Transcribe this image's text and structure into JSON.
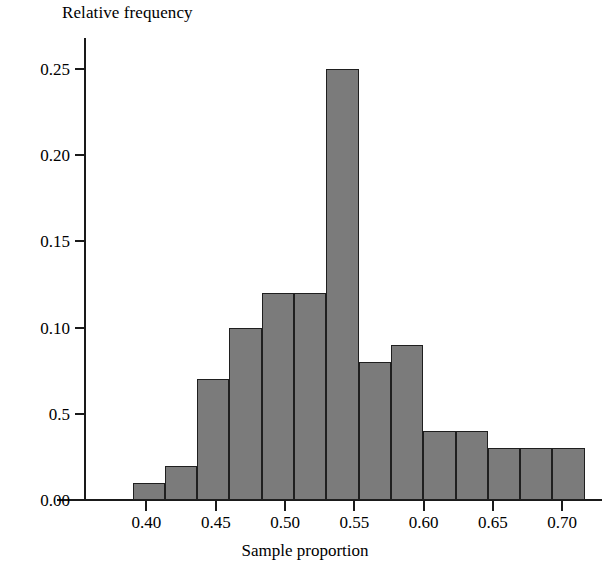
{
  "chart_data": {
    "type": "bar",
    "title": "",
    "xlabel": "Sample proportion",
    "ylabel": "Relative frequency",
    "grid": false,
    "legend": null,
    "xlim": [
      0.378,
      0.715
    ],
    "ylim": [
      0.0,
      0.268
    ],
    "xticks": [
      "0.40",
      "0.45",
      "0.50",
      "0.55",
      "0.60",
      "0.65",
      "0.70"
    ],
    "xtick_values": [
      0.4,
      0.45,
      0.5,
      0.55,
      0.6,
      0.65,
      0.7
    ],
    "yticks": [
      "0.00",
      "0.5",
      "0.10",
      "0.15",
      "0.20",
      "0.25"
    ],
    "ytick_values": [
      0.0,
      0.05,
      0.1,
      0.15,
      0.2,
      0.25
    ],
    "bin_width": 0.0233,
    "bin_edges": [
      0.39,
      0.4133,
      0.4366,
      0.4599,
      0.4832,
      0.5065,
      0.5298,
      0.5531,
      0.5764,
      0.5997,
      0.623,
      0.6463,
      0.6696,
      0.6929,
      0.7162
    ],
    "categories": [
      "0.390-0.413",
      "0.413-0.437",
      "0.437-0.460",
      "0.460-0.483",
      "0.483-0.507",
      "0.507-0.530",
      "0.530-0.553",
      "0.553-0.576",
      "0.576-0.600",
      "0.600-0.623",
      "0.623-0.646",
      "0.646-0.670",
      "0.670-0.693",
      "0.693-0.716"
    ],
    "values": [
      0.01,
      0.02,
      0.07,
      0.1,
      0.12,
      0.12,
      0.25,
      0.08,
      0.09,
      0.04,
      0.04,
      0.03,
      0.03,
      0.03
    ],
    "bar_color": "#7b7b7b",
    "bar_edge_color": "#1f1f1f",
    "axis_color": "#1a1a1a"
  },
  "axes": {
    "y_title": "Relative frequency",
    "x_title": "Sample proportion"
  }
}
